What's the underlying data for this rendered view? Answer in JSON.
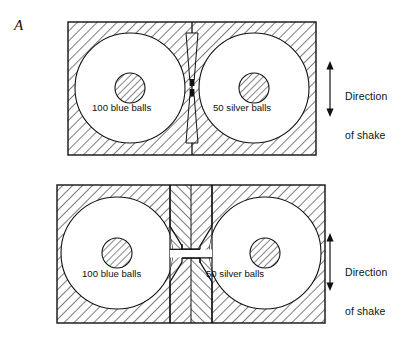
{
  "figure": {
    "panel_label": "A",
    "background_color": "#ffffff",
    "line_color": "#111111",
    "hatch_color": "#111111"
  },
  "panels": [
    {
      "id": "top",
      "name": "narrow-aperture-apparatus",
      "chambers": [
        {
          "id": "left",
          "label": "100 blue balls",
          "count": 100,
          "ball_color_name": "blue"
        },
        {
          "id": "right",
          "label": "50 silver balls",
          "count": 50,
          "ball_color_name": "silver"
        }
      ],
      "divider": {
        "type": "thin-wall-with-hourglass-aperture",
        "apertures": 2
      },
      "shake": {
        "line1": "Direction",
        "line2": "of shake",
        "arrow": "double-headed-vertical"
      }
    },
    {
      "id": "bottom",
      "name": "wide-funnel-apparatus",
      "chambers": [
        {
          "id": "left",
          "label": "100 blue balls",
          "count": 100,
          "ball_color_name": "blue"
        },
        {
          "id": "right",
          "label": "50 silver balls",
          "count": 50,
          "ball_color_name": "silver"
        }
      ],
      "divider": {
        "type": "thick-chevron-wall-with-funnel-slot",
        "apertures": 1
      },
      "shake": {
        "line1": "Direction",
        "line2": "of shake",
        "arrow": "double-headed-vertical"
      }
    }
  ]
}
